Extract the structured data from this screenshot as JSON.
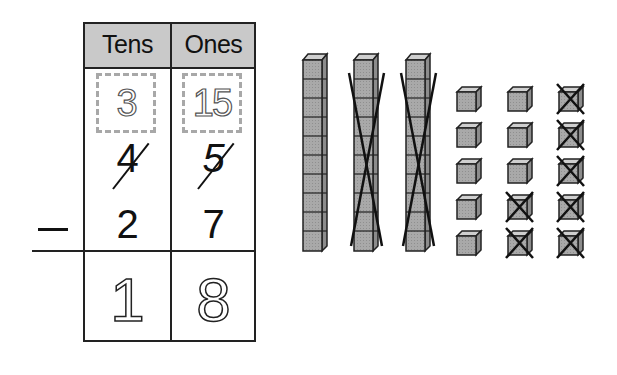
{
  "table": {
    "headers": [
      "Tens",
      "Ones"
    ],
    "regrouped": {
      "tens": "3",
      "ones": "15"
    },
    "minuend": {
      "tens": "4",
      "ones": "5",
      "crossed_out": true
    },
    "subtrahend": {
      "tens": "2",
      "ones": "7"
    },
    "operator": "−",
    "difference": {
      "tens": "1",
      "ones": "8",
      "style": "dotted-trace"
    }
  },
  "colors": {
    "header_bg": "#c9c9c9",
    "block_fill": "#a9a9a9",
    "block_top": "#cfcfcf",
    "block_side": "#8c8c8c",
    "line": "#222222",
    "trace_box": "#a8a8a8"
  },
  "blocks": {
    "rods": [
      {
        "units": 10,
        "crossed_out": false
      },
      {
        "units": 10,
        "crossed_out": true
      },
      {
        "units": 10,
        "crossed_out": true
      }
    ],
    "unit_columns": [
      {
        "cubes": [
          false,
          false,
          false,
          false,
          false
        ]
      },
      {
        "cubes": [
          false,
          false,
          false,
          true,
          true
        ]
      },
      {
        "cubes": [
          true,
          true,
          true,
          true,
          true
        ]
      }
    ]
  }
}
